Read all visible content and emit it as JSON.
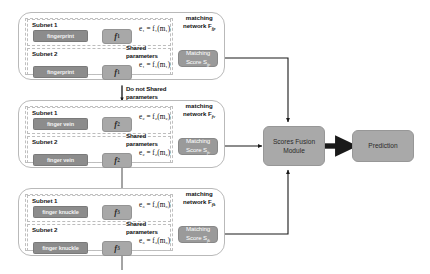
{
  "diagram": {
    "colors": {
      "input_box": "#8c8c8c",
      "feature_box": "#a8a8a8",
      "matching_box": "#9a9a9a",
      "fusion_box": "#a9a9a9",
      "prediction_box": "#a9a9a9",
      "group_border": "#b9b9b9",
      "subnet_border": "#bdbdbd",
      "arrow": "#1a1a1a"
    },
    "subnet_labels": {
      "one": "Subnet 1",
      "two": "Subnet 2"
    },
    "shared_label": "Shared\nparameters",
    "shared_label_line1": "Shared",
    "shared_label_line2": "parameters",
    "not_shared_line1": "Do not Shared",
    "not_shared_line2": "parameters",
    "branches": [
      {
        "id": "fingerprint",
        "modality": "fingerprint",
        "feature_extractor": "f",
        "feature_extractor_sub": "1",
        "embedding_eq": "e₁ = f₁(m₁)",
        "matching_network_line1": "matching",
        "matching_network_line2": "network F",
        "matching_network_sub": "fp",
        "matching_score_line1": "Matching",
        "matching_score_line2": "Score S",
        "matching_score_sub": "fp"
      },
      {
        "id": "finger-vein",
        "modality": "finger vein",
        "feature_extractor": "f",
        "feature_extractor_sub": "2",
        "embedding_eq": "e₂ = f₂(m₂)",
        "matching_network_line1": "matching",
        "matching_network_line2": "network F",
        "matching_network_sub": "fv",
        "matching_score_line1": "Matching",
        "matching_score_line2": "Score S",
        "matching_score_sub": "fv"
      },
      {
        "id": "finger-knuckle",
        "modality": "finger knuckle",
        "feature_extractor": "f",
        "feature_extractor_sub": "3",
        "embedding_eq": "e₃ = f₃(m₃)",
        "matching_network_line1": "matching",
        "matching_network_line2": "network F",
        "matching_network_sub": "fk",
        "matching_score_line1": "Matching",
        "matching_score_line2": "Score S",
        "matching_score_sub": "fk"
      }
    ],
    "fusion": {
      "line1": "Scores Fusion",
      "line2": "Module"
    },
    "prediction": {
      "label": "Prediction"
    }
  }
}
